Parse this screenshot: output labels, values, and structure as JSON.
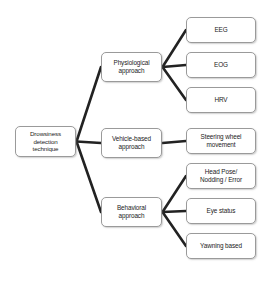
{
  "diagram": {
    "type": "tree-flowchart",
    "orientation": "left-to-right",
    "background_color": "#ffffff",
    "node_fill_color": "#ffffff",
    "node_border_color": "#9a9a9a",
    "edge_color": "#222222",
    "text_color": "#1b1b1b",
    "root": {
      "id": "root",
      "label": "Drowsiness\ndetection\ntechnique"
    },
    "categories": [
      {
        "id": "physiological",
        "label": "Physiological\napproach",
        "leaves": [
          {
            "id": "eeg",
            "label": "EEG"
          },
          {
            "id": "eog",
            "label": "EOG"
          },
          {
            "id": "hrv",
            "label": "HRV"
          }
        ]
      },
      {
        "id": "vehicle",
        "label": "Vehicle-based\napproach",
        "leaves": [
          {
            "id": "steering",
            "label": "Steering wheel\nmovement"
          }
        ]
      },
      {
        "id": "behavioral",
        "label": "Behavioral\napproach",
        "leaves": [
          {
            "id": "headpose",
            "label": "Head Pose/\nNodding / Error"
          },
          {
            "id": "eye",
            "label": "Eye status"
          },
          {
            "id": "yawning",
            "label": "Yawning based"
          }
        ]
      }
    ]
  }
}
